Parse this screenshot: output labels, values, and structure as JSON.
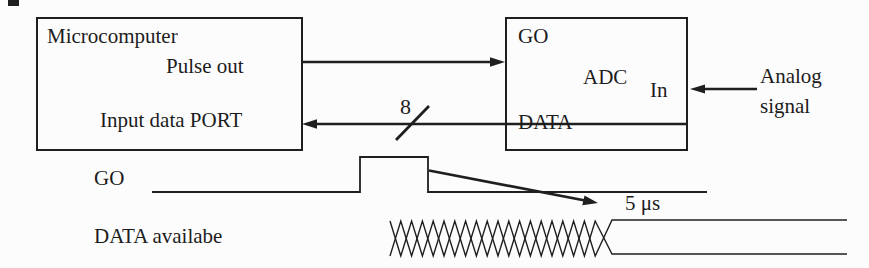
{
  "figure": {
    "microcomputer": {
      "title": "Microcomputer",
      "pulse_out": "Pulse out",
      "input_port": "Input data PORT"
    },
    "adc": {
      "pin_go": "GO",
      "title": "ADC",
      "pin_in": "In",
      "pin_data": "DATA"
    },
    "analog_line1": "Analog",
    "analog_line2": "signal",
    "bus_width": "8"
  },
  "timing": {
    "go_label": "GO",
    "data_label": "DATA availabe",
    "delay": "5 μs"
  },
  "colors": {
    "ink": "#1f1f1f",
    "background": "#fcfcfc"
  }
}
